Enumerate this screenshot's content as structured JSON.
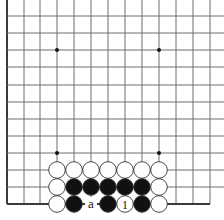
{
  "board": {
    "grid": {
      "x_lines": [
        7,
        24,
        40,
        57,
        74,
        91,
        108,
        125,
        142,
        159,
        176,
        193,
        210
      ],
      "y_lines": [
        16,
        33,
        50,
        67,
        85,
        102,
        119,
        136,
        153,
        170,
        187,
        204
      ],
      "left_edge_x": 7,
      "bottom_edge_y": 204,
      "line_color": "#6e6e6e",
      "edge_color": "#3a3a3a"
    },
    "star_points": [
      {
        "x": 57,
        "y": 50
      },
      {
        "x": 159,
        "y": 50
      },
      {
        "x": 57,
        "y": 153
      },
      {
        "x": 159,
        "y": 153
      }
    ],
    "stones": [
      {
        "color": "white",
        "x": 57,
        "y": 170
      },
      {
        "color": "white",
        "x": 74,
        "y": 170
      },
      {
        "color": "white",
        "x": 91,
        "y": 170
      },
      {
        "color": "white",
        "x": 108,
        "y": 170
      },
      {
        "color": "white",
        "x": 125,
        "y": 170
      },
      {
        "color": "white",
        "x": 142,
        "y": 170
      },
      {
        "color": "white",
        "x": 159,
        "y": 170
      },
      {
        "color": "white",
        "x": 57,
        "y": 187
      },
      {
        "color": "black",
        "x": 74,
        "y": 187
      },
      {
        "color": "black",
        "x": 91,
        "y": 187
      },
      {
        "color": "black",
        "x": 108,
        "y": 187
      },
      {
        "color": "black",
        "x": 125,
        "y": 187
      },
      {
        "color": "black",
        "x": 142,
        "y": 187
      },
      {
        "color": "white",
        "x": 159,
        "y": 187
      },
      {
        "color": "white",
        "x": 57,
        "y": 204
      },
      {
        "color": "black",
        "x": 74,
        "y": 204
      },
      {
        "color": "black",
        "x": 108,
        "y": 204
      },
      {
        "color": "white",
        "x": 125,
        "y": 204,
        "label": "1"
      },
      {
        "color": "black",
        "x": 142,
        "y": 204
      },
      {
        "color": "white",
        "x": 159,
        "y": 204
      }
    ],
    "labels": [
      {
        "text": "a",
        "x": 91,
        "y": 204
      }
    ]
  }
}
